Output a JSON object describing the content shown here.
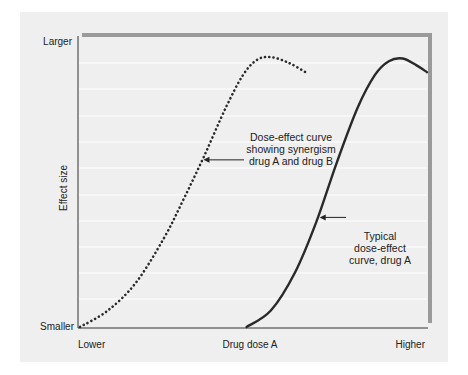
{
  "chart_data": {
    "type": "line",
    "title": "",
    "xlabel": "Drug dose A",
    "ylabel": "Effect size",
    "x_tick_labels": {
      "min": "Lower",
      "max": "Higher"
    },
    "y_tick_labels": {
      "min": "Smaller",
      "max": "Larger"
    },
    "xlim": [
      0,
      1
    ],
    "ylim": [
      0,
      1
    ],
    "grid": true,
    "series": [
      {
        "name": "Dose-effect curve showing synergism drug A and drug B",
        "style": "dotted",
        "x": [
          0.0,
          0.08,
          0.16,
          0.24,
          0.3,
          0.36,
          0.42,
          0.47,
          0.51,
          0.55,
          0.6,
          0.65
        ],
        "y": [
          0.0,
          0.06,
          0.16,
          0.32,
          0.47,
          0.63,
          0.8,
          0.92,
          0.975,
          0.985,
          0.965,
          0.93
        ]
      },
      {
        "name": "Typical dose-effect curve, drug A",
        "style": "solid",
        "x": [
          0.48,
          0.55,
          0.62,
          0.68,
          0.74,
          0.8,
          0.85,
          0.89,
          0.93,
          0.97,
          1.0
        ],
        "y": [
          0.0,
          0.06,
          0.2,
          0.38,
          0.6,
          0.8,
          0.92,
          0.97,
          0.98,
          0.955,
          0.93
        ]
      }
    ],
    "annotations": [
      {
        "text_lines": [
          "Dose-effect curve",
          "showing synergism",
          "drug A and drug B"
        ],
        "points_to": "dotted series",
        "arrow_target": {
          "x": 0.35,
          "y": 0.61
        }
      },
      {
        "text_lines": [
          "Typical",
          "dose-effect",
          "curve, drug A"
        ],
        "points_to": "solid series",
        "arrow_target": {
          "x": 0.685,
          "y": 0.4
        }
      }
    ]
  }
}
